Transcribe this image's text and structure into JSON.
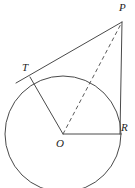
{
  "figure": {
    "background_color": "#ffffff",
    "stroke_color": "#4a4a4a",
    "label_color": "#1d1d1d",
    "width": 135,
    "height": 188
  },
  "circle": {
    "center_label": "O",
    "center_x": 63,
    "center_y": 134,
    "radius": 58
  },
  "points": [
    {
      "id": "P",
      "label": "P",
      "x": 122,
      "y": 22,
      "label_x": 119,
      "label_y": 2
    },
    {
      "id": "T",
      "label": "T",
      "x": 30,
      "y": 77,
      "label_x": 22,
      "label_y": 62
    },
    {
      "id": "O",
      "label": "O",
      "x": 63,
      "y": 134,
      "label_x": 56,
      "label_y": 138
    },
    {
      "id": "R",
      "label": "R",
      "x": 120,
      "y": 134,
      "label_x": 121,
      "label_y": 122
    }
  ],
  "segments": [
    {
      "id": "PT",
      "from": "P",
      "to": "T",
      "style": "solid"
    },
    {
      "id": "T-extension",
      "from": "T",
      "to": "tangent-end",
      "style": "solid"
    },
    {
      "id": "TO",
      "from": "T",
      "to": "O",
      "style": "solid"
    },
    {
      "id": "OR",
      "from": "O",
      "to": "R",
      "style": "solid"
    },
    {
      "id": "RP",
      "from": "R",
      "to": "P",
      "style": "solid"
    },
    {
      "id": "OP",
      "from": "O",
      "to": "P",
      "style": "dashed"
    }
  ]
}
